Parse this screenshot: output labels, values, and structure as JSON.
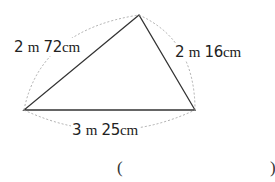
{
  "diagram": {
    "shape": "triangle",
    "sides": [
      {
        "id": "left",
        "num1": "2",
        "unit1": "m",
        "num2": "72",
        "unit2": "cm"
      },
      {
        "id": "right",
        "num1": "2",
        "unit1": "m",
        "num2": "16",
        "unit2": "cm"
      },
      {
        "id": "bottom",
        "num1": "3",
        "unit1": "m",
        "num2": "25",
        "unit2": "cm"
      }
    ]
  },
  "answer": {
    "open": "(",
    "close": ")",
    "value": ""
  }
}
